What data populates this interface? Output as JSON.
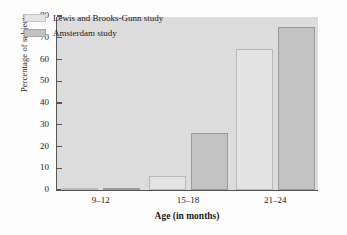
{
  "chart_data": {
    "type": "bar",
    "title": "",
    "xlabel": "Age (in months)",
    "ylabel": "Percentage of subjects",
    "categories": [
      "9–12",
      "15–18",
      "21–24"
    ],
    "series": [
      {
        "name": "Lewis and Brooks-Gunn study",
        "values": [
          0.5,
          6.5,
          65
        ],
        "color": "#e3e3e3"
      },
      {
        "name": "Amsterdam study",
        "values": [
          1,
          26,
          75
        ],
        "color": "#c2c2c2"
      }
    ],
    "ylim": [
      0,
      80
    ],
    "yticks": [
      0,
      10,
      20,
      30,
      40,
      50,
      60,
      70,
      80
    ],
    "grid": false,
    "legend_position": "upper-left",
    "plot_background": "#dcdcdc"
  },
  "legend": {
    "items": [
      {
        "label": "Lewis and Brooks-Gunn study",
        "swatch": "lewis"
      },
      {
        "label": "Amsterdam study",
        "swatch": "amsterdam"
      }
    ]
  }
}
